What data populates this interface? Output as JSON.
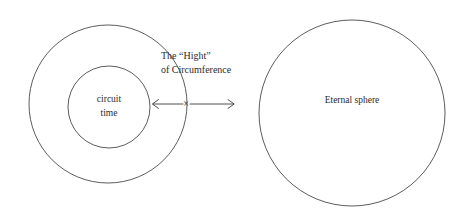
{
  "figure": {
    "type": "concentric-circle-diagram",
    "background_color": "#ffffff",
    "stroke_color": "#4a4a4a",
    "text_color": "#2b2b2b"
  },
  "labels": {
    "inner_circle_line1": "circuit",
    "inner_circle_line2": "time",
    "right_circle": "Eternal sphere",
    "annotation_line1": "The “Hight”",
    "annotation_line2": "of Circumference",
    "intersection_marker": "×"
  },
  "shapes": {
    "outer_circle": {
      "cx": 108,
      "cy": 104,
      "r": 79
    },
    "inner_circle": {
      "cx": 109,
      "cy": 107,
      "r": 41
    },
    "right_circle": {
      "cx": 352,
      "cy": 113,
      "r": 93
    }
  },
  "arrows": {
    "left_arrow": {
      "from_x": 184,
      "to_x": 152,
      "y": 104,
      "direction": "left"
    },
    "right_arrow": {
      "from_x": 190,
      "to_x": 235,
      "y": 104,
      "direction": "right"
    }
  }
}
